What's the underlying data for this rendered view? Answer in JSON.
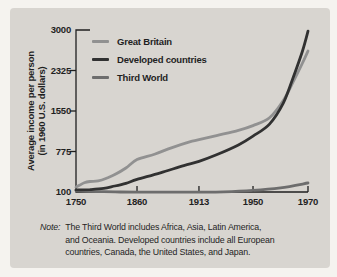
{
  "figure": {
    "bg_outer": "#f5f3ef",
    "bg_panel": "#d8d5d0",
    "text_color": "#1f1f1f"
  },
  "chart_data": {
    "type": "line",
    "title": "",
    "ylabel_line1": "Average income per person",
    "ylabel_line2": "(in 1960 U.S. dollars)",
    "xlabel": "",
    "axis_color": "#1f1f1f",
    "grid": false,
    "legend_position": "top-left",
    "y_ticks": [
      100,
      775,
      1550,
      2325,
      3000
    ],
    "x_ticks": [
      {
        "label": "1750",
        "frac": 0
      },
      {
        "label": "1860",
        "frac": 0.263
      },
      {
        "label": "1913",
        "frac": 0.53
      },
      {
        "label": "1950",
        "frac": 0.763
      },
      {
        "label": "1970",
        "frac": 1
      }
    ],
    "series": [
      {
        "name": "Third World",
        "color": "#6d6d6d",
        "points": [
          [
            1750,
            125
          ],
          [
            1775,
            112
          ],
          [
            1800,
            105
          ],
          [
            1830,
            100
          ],
          [
            1860,
            98
          ],
          [
            1890,
            97
          ],
          [
            1913,
            97
          ],
          [
            1930,
            103
          ],
          [
            1950,
            128
          ],
          [
            1960,
            170
          ],
          [
            1970,
            250
          ]
        ]
      },
      {
        "name": "Great Britain",
        "color": "#919191",
        "points": [
          [
            1750,
            180
          ],
          [
            1757,
            215
          ],
          [
            1765,
            255
          ],
          [
            1775,
            275
          ],
          [
            1790,
            285
          ],
          [
            1805,
            330
          ],
          [
            1820,
            390
          ],
          [
            1840,
            500
          ],
          [
            1860,
            640
          ],
          [
            1875,
            730
          ],
          [
            1890,
            850
          ],
          [
            1905,
            960
          ],
          [
            1913,
            1000
          ],
          [
            1925,
            1080
          ],
          [
            1940,
            1180
          ],
          [
            1950,
            1270
          ],
          [
            1956,
            1420
          ],
          [
            1961,
            1750
          ],
          [
            1965,
            2150
          ],
          [
            1968,
            2450
          ],
          [
            1970,
            2650
          ]
        ]
      },
      {
        "name": "Developed countries",
        "color": "#313131",
        "points": [
          [
            1750,
            135
          ],
          [
            1775,
            140
          ],
          [
            1800,
            160
          ],
          [
            1820,
            200
          ],
          [
            1840,
            245
          ],
          [
            1860,
            310
          ],
          [
            1880,
            420
          ],
          [
            1900,
            540
          ],
          [
            1913,
            610
          ],
          [
            1925,
            720
          ],
          [
            1940,
            900
          ],
          [
            1950,
            1070
          ],
          [
            1956,
            1300
          ],
          [
            1961,
            1700
          ],
          [
            1965,
            2250
          ],
          [
            1968,
            2650
          ],
          [
            1970,
            2980
          ]
        ]
      }
    ],
    "legend_order": [
      "Great Britain",
      "Developed countries",
      "Third World"
    ],
    "note": {
      "label": "Note:",
      "lines": [
        "The Third World includes Africa, Asia, Latin America,",
        "and Oceania. Developed countries include all European",
        "countries, Canada, the United States, and Japan."
      ]
    }
  }
}
